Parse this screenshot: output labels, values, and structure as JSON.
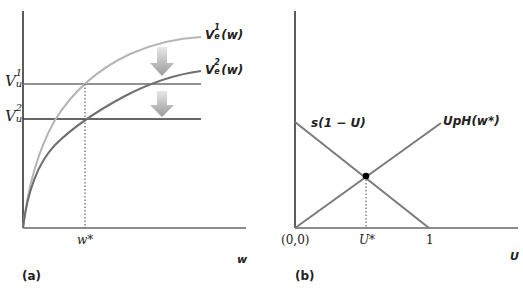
{
  "panels": [
    {
      "id": "a",
      "caption": "(a)",
      "x_axis_label": "w",
      "x_tick_label": "w*",
      "y_labels": [
        {
          "base": "V",
          "sup": "1",
          "sub": "u"
        },
        {
          "base": "V",
          "sub": "u",
          "sup": "2"
        }
      ],
      "curves": [
        {
          "label_base": "V",
          "label_sup": "1",
          "label_sub": "e",
          "label_arg": "(w)",
          "color": "#b5b5b5"
        },
        {
          "label_base": "V",
          "label_sup": "2",
          "label_sub": "e",
          "label_arg": "(w)",
          "color": "#707070"
        }
      ],
      "horizontal_lines": [
        {
          "name": "Vu1",
          "color": "#6e6e6e"
        },
        {
          "name": "Vu2",
          "color": "#333333"
        }
      ],
      "arrows": 2
    },
    {
      "id": "b",
      "caption": "(b)",
      "x_axis_label": "U",
      "origin_label": "(0,0)",
      "x_tick_labels": [
        "U*",
        "1"
      ],
      "lines": [
        {
          "label": "s(1 − U)",
          "color": "#7a7a7a"
        },
        {
          "label": "UpH(w*)",
          "color": "#7a7a7a"
        }
      ],
      "equilibrium_point_color": "#000000"
    }
  ]
}
